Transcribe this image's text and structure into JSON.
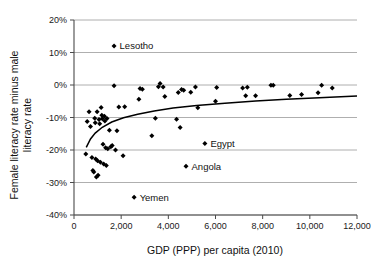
{
  "chart_data": {
    "type": "scatter",
    "title": "",
    "xlabel": "GDP (PPP) per capita (2010)",
    "ylabel_line1": "Female literacy rate minus male",
    "ylabel_line2": "literacy rate",
    "ylabel": "Female literacy rate minus male literacy rate",
    "xlim": [
      0,
      12000
    ],
    "ylim": [
      -40,
      20
    ],
    "xticks": [
      0,
      2000,
      4000,
      6000,
      8000,
      10000,
      12000
    ],
    "xtick_labels": [
      "0",
      "2,000",
      "4,000",
      "6,000",
      "8,000",
      "10,000",
      "12,000"
    ],
    "yticks": [
      20,
      10,
      0,
      -10,
      -20,
      -30,
      -40
    ],
    "ytick_labels": [
      "20%",
      "10%",
      "0%",
      "-10%",
      "-20%",
      "-30%",
      "-40%"
    ],
    "grid": "horizontal",
    "legend": "none",
    "marker": "diamond",
    "marker_color": "#000000",
    "points": [
      {
        "x": 1700,
        "y": 12.0,
        "label": "Lesotho"
      },
      {
        "x": 5550,
        "y": -18.0,
        "label": "Egypt"
      },
      {
        "x": 4750,
        "y": -25.0,
        "label": "Angola"
      },
      {
        "x": 2550,
        "y": -34.5,
        "label": "Yemen"
      },
      {
        "x": 500,
        "y": -21.2,
        "label": ""
      },
      {
        "x": 560,
        "y": -11.2,
        "label": ""
      },
      {
        "x": 640,
        "y": -8.2,
        "label": ""
      },
      {
        "x": 700,
        "y": -12.8,
        "label": ""
      },
      {
        "x": 760,
        "y": -22.3,
        "label": ""
      },
      {
        "x": 800,
        "y": -26.3,
        "label": ""
      },
      {
        "x": 840,
        "y": -26.8,
        "label": ""
      },
      {
        "x": 880,
        "y": -10.2,
        "label": ""
      },
      {
        "x": 900,
        "y": -11.6,
        "label": ""
      },
      {
        "x": 920,
        "y": -22.8,
        "label": ""
      },
      {
        "x": 950,
        "y": -28.3,
        "label": ""
      },
      {
        "x": 980,
        "y": -8.2,
        "label": ""
      },
      {
        "x": 1000,
        "y": -23.3,
        "label": ""
      },
      {
        "x": 1020,
        "y": -27.8,
        "label": ""
      },
      {
        "x": 1060,
        "y": -10.6,
        "label": ""
      },
      {
        "x": 1090,
        "y": -11.9,
        "label": ""
      },
      {
        "x": 1120,
        "y": -23.8,
        "label": ""
      },
      {
        "x": 1150,
        "y": -6.9,
        "label": ""
      },
      {
        "x": 1180,
        "y": -9.3,
        "label": ""
      },
      {
        "x": 1200,
        "y": -10.4,
        "label": ""
      },
      {
        "x": 1230,
        "y": -18.2,
        "label": ""
      },
      {
        "x": 1260,
        "y": -24.3,
        "label": ""
      },
      {
        "x": 1290,
        "y": -9.6,
        "label": ""
      },
      {
        "x": 1310,
        "y": -11.1,
        "label": ""
      },
      {
        "x": 1340,
        "y": -19.3,
        "label": ""
      },
      {
        "x": 1370,
        "y": -24.8,
        "label": ""
      },
      {
        "x": 1400,
        "y": -10.3,
        "label": ""
      },
      {
        "x": 1430,
        "y": -19.6,
        "label": ""
      },
      {
        "x": 1500,
        "y": -13.9,
        "label": ""
      },
      {
        "x": 1560,
        "y": -19.0,
        "label": ""
      },
      {
        "x": 1620,
        "y": -18.6,
        "label": ""
      },
      {
        "x": 1700,
        "y": -0.2,
        "label": ""
      },
      {
        "x": 1760,
        "y": -20.0,
        "label": ""
      },
      {
        "x": 1820,
        "y": -14.1,
        "label": ""
      },
      {
        "x": 1900,
        "y": -6.8,
        "label": ""
      },
      {
        "x": 2080,
        "y": -21.8,
        "label": ""
      },
      {
        "x": 2150,
        "y": -6.7,
        "label": ""
      },
      {
        "x": 2750,
        "y": -4.4,
        "label": ""
      },
      {
        "x": 2800,
        "y": -1.1,
        "label": ""
      },
      {
        "x": 2900,
        "y": -1.3,
        "label": ""
      },
      {
        "x": 3300,
        "y": -15.6,
        "label": ""
      },
      {
        "x": 3450,
        "y": -10.2,
        "label": ""
      },
      {
        "x": 3580,
        "y": -0.5,
        "label": ""
      },
      {
        "x": 3650,
        "y": 0.5,
        "label": ""
      },
      {
        "x": 3780,
        "y": -0.6,
        "label": ""
      },
      {
        "x": 3850,
        "y": -3.5,
        "label": ""
      },
      {
        "x": 4350,
        "y": -10.5,
        "label": ""
      },
      {
        "x": 4420,
        "y": -2.3,
        "label": ""
      },
      {
        "x": 4500,
        "y": -13.1,
        "label": ""
      },
      {
        "x": 4560,
        "y": -1.4,
        "label": ""
      },
      {
        "x": 4650,
        "y": -1.6,
        "label": ""
      },
      {
        "x": 4950,
        "y": -2.2,
        "label": ""
      },
      {
        "x": 5150,
        "y": -0.6,
        "label": ""
      },
      {
        "x": 5250,
        "y": -7.0,
        "label": ""
      },
      {
        "x": 6000,
        "y": -5.0,
        "label": ""
      },
      {
        "x": 6050,
        "y": -0.8,
        "label": ""
      },
      {
        "x": 7150,
        "y": -0.9,
        "label": ""
      },
      {
        "x": 7280,
        "y": -3.3,
        "label": ""
      },
      {
        "x": 7350,
        "y": -0.7,
        "label": ""
      },
      {
        "x": 7700,
        "y": -3.3,
        "label": ""
      },
      {
        "x": 8350,
        "y": -0.1,
        "label": ""
      },
      {
        "x": 8450,
        "y": -0.1,
        "label": ""
      },
      {
        "x": 9150,
        "y": -3.2,
        "label": ""
      },
      {
        "x": 9650,
        "y": -2.9,
        "label": ""
      },
      {
        "x": 10350,
        "y": -2.4,
        "label": ""
      },
      {
        "x": 10500,
        "y": -0.1,
        "label": ""
      },
      {
        "x": 10950,
        "y": -0.9,
        "label": ""
      }
    ],
    "trendline": {
      "type": "logarithmic",
      "points": [
        {
          "x": 520,
          "y": -19.2
        },
        {
          "x": 700,
          "y": -16.6
        },
        {
          "x": 900,
          "y": -14.8
        },
        {
          "x": 1200,
          "y": -13.0
        },
        {
          "x": 1600,
          "y": -11.4
        },
        {
          "x": 2100,
          "y": -10.1
        },
        {
          "x": 2700,
          "y": -9.0
        },
        {
          "x": 3400,
          "y": -8.0
        },
        {
          "x": 4200,
          "y": -7.1
        },
        {
          "x": 5200,
          "y": -6.3
        },
        {
          "x": 6400,
          "y": -5.6
        },
        {
          "x": 7700,
          "y": -4.9
        },
        {
          "x": 9000,
          "y": -4.4
        },
        {
          "x": 10400,
          "y": -3.9
        },
        {
          "x": 12000,
          "y": -3.4
        }
      ]
    }
  }
}
